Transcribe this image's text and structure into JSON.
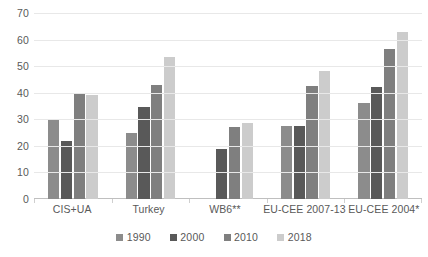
{
  "chart_data": {
    "type": "bar",
    "title": "",
    "subtitle": "",
    "xlabel": "",
    "ylabel": "",
    "ylim": [
      0,
      70
    ],
    "ytick_step": 10,
    "yticks": [
      "0",
      "10",
      "20",
      "30",
      "40",
      "50",
      "60",
      "70"
    ],
    "grid": true,
    "grid_axis": "y",
    "legend_position": "bottom",
    "categories": [
      "CIS+UA",
      "Turkey",
      "WB6**",
      "EU-CEE 2007-13",
      "EU-CEE 2004*"
    ],
    "series": [
      {
        "name": "1990",
        "color": "#8c8c8c",
        "values": [
          30,
          25,
          null,
          27.5,
          36
        ]
      },
      {
        "name": "2000",
        "color": "#595959",
        "values": [
          22,
          34.5,
          19,
          27.5,
          42
        ]
      },
      {
        "name": "2010",
        "color": "#7f7f7f",
        "values": [
          40,
          43,
          27,
          42.5,
          56.5
        ]
      },
      {
        "name": "2018",
        "color": "#cccccc",
        "values": [
          39,
          53.5,
          28.5,
          48,
          63
        ]
      }
    ]
  },
  "colors": {
    "gridline": "#e8e8e8",
    "axis": "#bfbfbf",
    "tick_text": "#595959",
    "background": "#ffffff"
  }
}
